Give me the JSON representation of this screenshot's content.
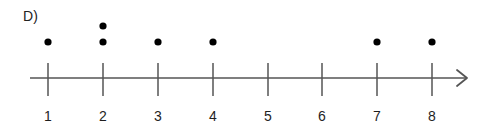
{
  "panel": {
    "label": "D)"
  },
  "axis": {
    "line_color": "#555555",
    "tick_color": "#555555",
    "arrow_direction": "right",
    "arrow_label": "arrow-right"
  },
  "dot_color": "#000000",
  "chart_data": {
    "type": "scatter",
    "title": "",
    "subtitle": "",
    "xlabel": "",
    "ylabel": "",
    "categories": [
      "1",
      "2",
      "3",
      "4",
      "5",
      "6",
      "7",
      "8"
    ],
    "values": [
      1,
      2,
      1,
      1,
      0,
      0,
      1,
      1
    ],
    "tick_labels": [
      "1",
      "2",
      "3",
      "4",
      "5",
      "6",
      "7",
      "8"
    ],
    "xlim": [
      1,
      8
    ],
    "grid": false,
    "legend": "none",
    "annotations": [
      "D)"
    ]
  }
}
